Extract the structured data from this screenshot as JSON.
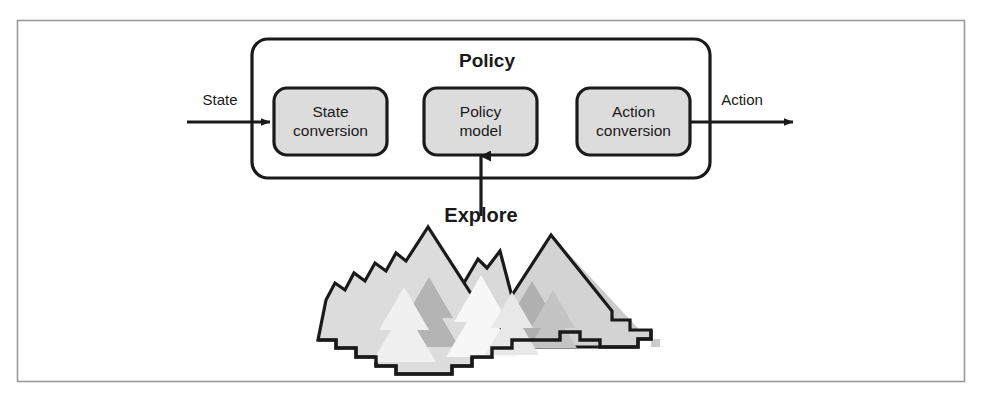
{
  "figure": {
    "title": "Policy",
    "container_label": "Policy",
    "page_frame": {
      "border_color": "#9a9a9a",
      "background": "#ffffff"
    },
    "colors": {
      "stroke": "#1a1a1a",
      "box_fill": "#dcdcdc",
      "container_fill": "#ffffff",
      "mountain_light": "#d9d9d9",
      "mountain_mid": "#bdbdbd",
      "mountain_dark": "#a8a8a8",
      "tree_light": "#f2f2f2",
      "tree_mid": "#cfcfcf",
      "text": "#1a1a1a"
    },
    "blocks": [
      {
        "id": "state-conversion",
        "line1": "State",
        "line2": "conversion"
      },
      {
        "id": "policy-model",
        "line1": "Policy",
        "line2": "model"
      },
      {
        "id": "action-conversion",
        "line1": "Action",
        "line2": "conversion"
      }
    ],
    "edges": [
      {
        "id": "state-input",
        "label": "State",
        "direction": "right"
      },
      {
        "id": "action-output",
        "label": "Action",
        "direction": "right"
      },
      {
        "id": "explore-input",
        "label": "Explore",
        "direction": "up"
      }
    ],
    "annotations": {
      "explore": "Explore"
    }
  }
}
